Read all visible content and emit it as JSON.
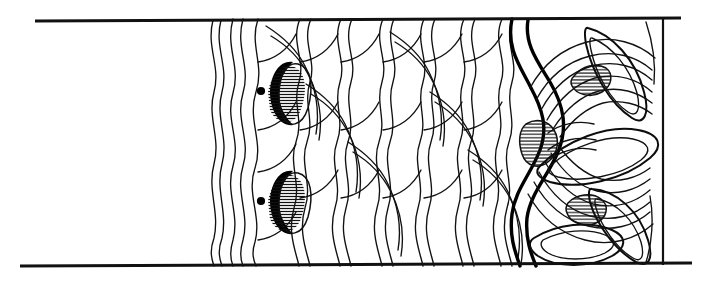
{
  "figure": {
    "title": "Decorated band line drawing",
    "medium": "ink line art",
    "background_color": "#ffffff",
    "ink_color": "#111111"
  },
  "canvas": {
    "width": 710,
    "height": 283
  },
  "rules": {
    "top": {
      "label": "top rule",
      "x1": 35,
      "y1": 21,
      "x2": 681,
      "y2": 18
    },
    "bottom": {
      "label": "bottom rule",
      "x1": 20,
      "y1": 266,
      "x2": 692,
      "y2": 263
    },
    "right_border": {
      "label": "right vertical border",
      "x": 663,
      "y1": 19,
      "y2": 265
    }
  },
  "regions": {
    "blank_left": {
      "label": "blank left margin",
      "x_start": 0,
      "x_end": 210
    },
    "wave_field": {
      "label": "wavy feather field",
      "x_start": 210,
      "x_end": 520
    },
    "rosette": {
      "label": "concentric rosette",
      "x_start": 500,
      "x_end": 663
    }
  },
  "eye_motifs": [
    {
      "name": "upper eye motif",
      "cx": 284,
      "cy": 92,
      "dot": {
        "cx": 261,
        "cy": 91,
        "r": 4.1
      }
    },
    {
      "name": "lower eye motif",
      "cx": 284,
      "cy": 201,
      "dot": {
        "cx": 261,
        "cy": 201,
        "r": 4.1
      }
    }
  ],
  "hatched_wedges": [
    {
      "name": "wedge-mid",
      "cx": 539,
      "cy": 141
    },
    {
      "name": "wedge-upper",
      "cx": 589,
      "cy": 75
    },
    {
      "name": "wedge-lower",
      "cx": 584,
      "cy": 208
    }
  ],
  "petals": [
    {
      "name": "petal-upper-right",
      "cx": 616,
      "cy": 72,
      "angle": -62
    },
    {
      "name": "petal-middle",
      "cx": 600,
      "cy": 143,
      "angle": -12
    },
    {
      "name": "petal-lower-right",
      "cx": 615,
      "cy": 215,
      "angle": 58
    },
    {
      "name": "petal-lower-center",
      "cx": 580,
      "cy": 250,
      "angle": 20
    }
  ],
  "counts": {
    "wave_strands": 14,
    "eye_motifs": 2,
    "rosette_rings": 6,
    "petals": 4
  }
}
